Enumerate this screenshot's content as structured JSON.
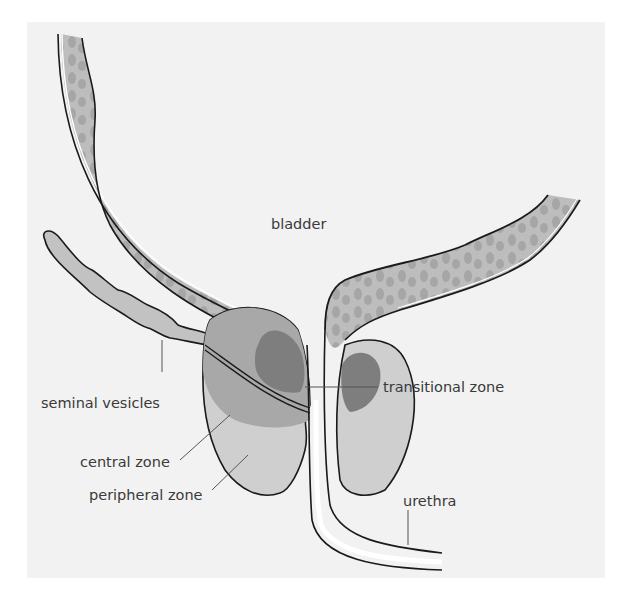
{
  "diagram": {
    "colors": {
      "background": "#f2f2f2",
      "wall": "#bdbdbd",
      "wall_texture": "#a6a6a6",
      "vesicles": "#c2c2c2",
      "central_zone": "#a8a8a8",
      "peripheral_zone": "#cfcfcf",
      "transitional_zone": "#7e7e7e",
      "outline": "#1a1a1a",
      "leader": "#555555"
    },
    "labels": {
      "bladder": "bladder",
      "seminal_vesicles": "seminal vesicles",
      "central_zone": "central zone",
      "peripheral_zone": "peripheral zone",
      "transitional_zone": "transitional zone",
      "urethra": "urethra"
    }
  }
}
